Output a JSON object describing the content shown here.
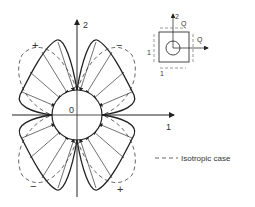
{
  "diagram": {
    "axes": {
      "vertical_label": "2",
      "horizontal_label": "1",
      "origin_label": "0"
    },
    "quadrant_signs": {
      "top_left": "+",
      "top_right": "−",
      "bottom_left": "−",
      "bottom_right": "+"
    },
    "inset": {
      "axis_2_label": "2",
      "shear_label_top": "Q",
      "shear_label_right": "Q",
      "stress_label_left": "1",
      "stress_label_bottom": "1"
    },
    "legend": {
      "dash_sample": "---",
      "text": "Isotropic case"
    },
    "colors": {
      "line": "#222222",
      "dashed": "#555555",
      "background": "#ffffff"
    }
  }
}
